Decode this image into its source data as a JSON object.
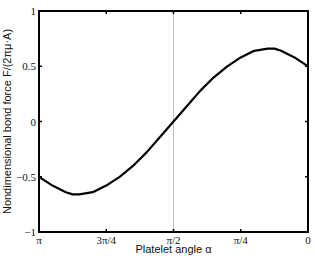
{
  "chart_data": {
    "type": "line",
    "title": "",
    "xlabel": "Platelet angle α",
    "ylabel": "Nondimensional bond force F/(2πμ·A)",
    "xlim": [
      3.14159,
      0
    ],
    "ylim": [
      -1,
      1
    ],
    "x_reversed": true,
    "grid": false,
    "legend": null,
    "x_ticks": [
      {
        "value": 3.14159,
        "label": "π"
      },
      {
        "value": 2.35619,
        "label": "3π/4"
      },
      {
        "value": 1.5708,
        "label": "π/2"
      },
      {
        "value": 0.7854,
        "label": "π/4"
      },
      {
        "value": 0,
        "label": "0"
      }
    ],
    "y_ticks": [
      {
        "value": 1,
        "label": "1"
      },
      {
        "value": 0.5,
        "label": "0.5"
      },
      {
        "value": 0,
        "label": "0"
      },
      {
        "value": -0.5,
        "label": "−0.5"
      },
      {
        "value": -1,
        "label": "−1"
      }
    ],
    "annotations": [
      {
        "type": "vertical-line",
        "x": 1.5708,
        "color": "#bbbbbb"
      }
    ],
    "series": [
      {
        "name": "bond force",
        "color": "#000000",
        "x": [
          3.1416,
          2.9845,
          2.8274,
          2.7489,
          2.6704,
          2.5133,
          2.3562,
          2.1991,
          2.042,
          1.885,
          1.7279,
          1.5708,
          1.4137,
          1.2566,
          1.0996,
          0.9425,
          0.7854,
          0.6283,
          0.4712,
          0.3927,
          0.3142,
          0.1571,
          0.0
        ],
        "y": [
          -0.5,
          -0.58,
          -0.64,
          -0.66,
          -0.66,
          -0.64,
          -0.58,
          -0.5,
          -0.4,
          -0.28,
          -0.14,
          0.0,
          0.14,
          0.28,
          0.4,
          0.5,
          0.58,
          0.64,
          0.66,
          0.66,
          0.64,
          0.58,
          0.5
        ]
      }
    ]
  }
}
